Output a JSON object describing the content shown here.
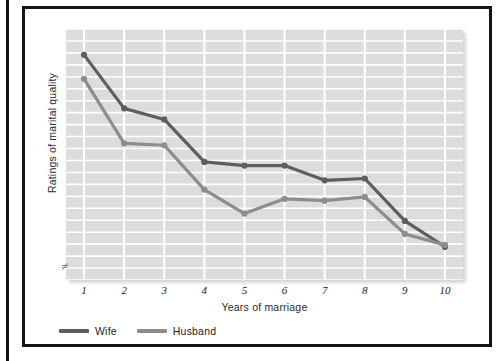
{
  "figure": {
    "frame_border_color": "#141414",
    "background_color": "#ffffff"
  },
  "chart_data": {
    "type": "line",
    "title": "",
    "xlabel": "Years of marriage",
    "ylabel": "Ratings of marital quality",
    "x": [
      1,
      2,
      3,
      4,
      5,
      6,
      7,
      8,
      9,
      10
    ],
    "categories": [
      "1",
      "2",
      "3",
      "4",
      "5",
      "6",
      "7",
      "8",
      "9",
      "10"
    ],
    "series": [
      {
        "name": "Wife",
        "color": "#5e5e5e",
        "values": [
          9.5,
          8.05,
          7.75,
          6.6,
          6.5,
          6.5,
          6.1,
          6.15,
          5.0,
          4.3
        ]
      },
      {
        "name": "Husband",
        "color": "#8d8d8d",
        "values": [
          8.85,
          7.1,
          7.05,
          5.85,
          5.2,
          5.6,
          5.55,
          5.65,
          4.65,
          4.35
        ]
      }
    ],
    "ylim": [
      3.4,
      10.2
    ],
    "xlim": [
      0.55,
      10.45
    ],
    "y_axis_ticks_shown": false,
    "y_axis_break": true,
    "y_axis_break_symbol": "≠",
    "grid": {
      "enabled": true,
      "color": "#ffffff",
      "horizontal_lines": 21,
      "vertical_at_categories": true
    },
    "plot_background_color": "#dcdcdc",
    "legend": {
      "position": "below-left",
      "entries": [
        "Wife",
        "Husband"
      ]
    },
    "marker": {
      "shape": "circle",
      "radius": 3.1
    },
    "line_width": 3.2
  },
  "legend": {
    "items": [
      {
        "label": "Wife",
        "color": "#5e5e5e"
      },
      {
        "label": "Husband",
        "color": "#8d8d8d"
      }
    ]
  },
  "axes": {
    "x_title": "Years of marriage",
    "y_title": "Ratings of marital quality",
    "x_ticks": [
      "1",
      "2",
      "3",
      "4",
      "5",
      "6",
      "7",
      "8",
      "9",
      "10"
    ],
    "break_symbol": "≠"
  }
}
